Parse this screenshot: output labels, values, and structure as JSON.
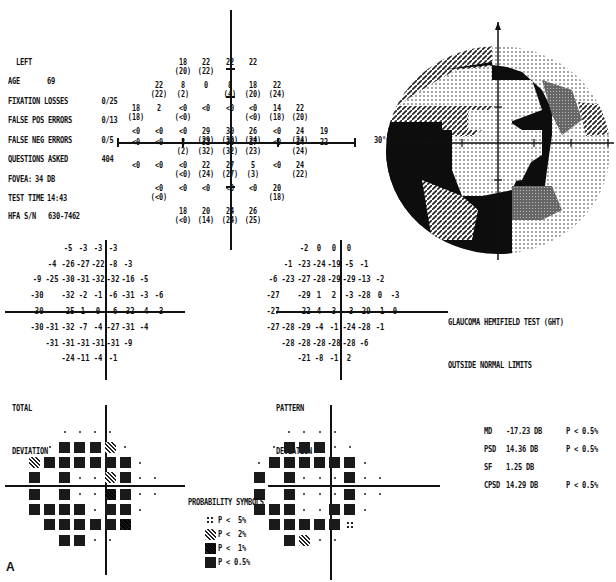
{
  "header": {
    "eye": "LEFT",
    "rows": [
      {
        "label": "AGE",
        "value": "69"
      },
      {
        "label": "FIXATION LOSSES",
        "value": "0/25"
      },
      {
        "label": "FALSE POS ERRORS",
        "value": "0/13"
      },
      {
        "label": "FALSE NEG ERRORS",
        "value": "0/5"
      },
      {
        "label": "QUESTIONS ASKED",
        "value": "404"
      },
      {
        "label": "FOVEA:",
        "value": "34 DB"
      },
      {
        "label": "TEST TIME",
        "value": "14:43"
      }
    ],
    "serial": "HFA S/N   630-7462"
  },
  "grayscale": {
    "angle_label": "30°"
  },
  "labels": {
    "total_deviation": [
      "TOTAL",
      "DEVIATION"
    ],
    "pattern_deviation": [
      "PATTERN",
      "DEVIATION"
    ],
    "figure_letter": "A"
  },
  "ght": {
    "line1": "GLAUCOMA HEMIFIELD TEST (GHT)",
    "line2": "OUTSIDE NORMAL LIMITS"
  },
  "indices": [
    {
      "name": "MD",
      "value": "-17.23 DB",
      "p": "P < 0.5%"
    },
    {
      "name": "PSD",
      "value": "14.36 DB",
      "p": "P < 0.5%"
    },
    {
      "name": "SF",
      "value": "1.25 DB",
      "p": ""
    },
    {
      "name": "CPSD",
      "value": "14.29 DB",
      "p": "P < 0.5%"
    }
  ],
  "legend": {
    "title": "PROBABILITY SYMBOLS",
    "items": [
      {
        "symbol": "p5",
        "label": "P <  5%"
      },
      {
        "symbol": "p2",
        "label": "P <  2%"
      },
      {
        "symbol": "p1",
        "label": "P <  1%"
      },
      {
        "symbol": "sq",
        "label": "P < 0.5%"
      }
    ]
  },
  "chart_data": [
    {
      "type": "table",
      "title": "Threshold values (dB), repeat in parentheses",
      "rows": [
        [
          "",
          "",
          "",
          "18 (20)",
          "22 (22)",
          "22",
          "22",
          "",
          "",
          ""
        ],
        [
          "",
          "",
          "22 (22)",
          "8 (2)",
          "0",
          "8 (4)",
          "18 (20)",
          "22 (24)",
          "",
          ""
        ],
        [
          "",
          "18 (18)",
          "2",
          "<0 (<0)",
          "<0",
          "<0",
          "<0 (<0)",
          "14 (18)",
          "22 (20)",
          ""
        ],
        [
          "",
          "<0",
          "<0",
          "<0",
          "29 (29)",
          "30 (30)",
          "26 (24)",
          "<0",
          "24 (24)",
          "19"
        ],
        [
          "",
          "<0",
          "<0",
          "8 (2)",
          "32 (32)",
          "30 (32)",
          "27 (23)",
          "<0",
          "24 (24)",
          "22"
        ],
        [
          "",
          "<0",
          "<0",
          "<0 (<0)",
          "22 (24)",
          "27 (27)",
          "5 (3)",
          "<0",
          "24 (22)",
          ""
        ],
        [
          "",
          "",
          "<0 (<0)",
          "<0",
          "<0",
          "<0",
          "<0",
          "20 (18)",
          "",
          ""
        ],
        [
          "",
          "",
          "",
          "18 (<0)",
          "20 (14)",
          "24 (24)",
          "26 (25)",
          "",
          "",
          ""
        ]
      ]
    },
    {
      "type": "table",
      "title": "TOTAL DEVIATION",
      "rows": [
        [
          "",
          "",
          "",
          "-5",
          "-3",
          "-3",
          "-3",
          "",
          "",
          ""
        ],
        [
          "",
          "",
          "-4",
          "-26",
          "-27",
          "-22",
          "-8",
          "-3",
          "",
          ""
        ],
        [
          "",
          "-9",
          "-25",
          "-30",
          "-31",
          "-32",
          "-32",
          "-16",
          "-5",
          ""
        ],
        [
          "",
          "-30",
          "",
          "-32",
          "-2",
          "-1",
          "-6",
          "-31",
          "-3",
          "-6"
        ],
        [
          "",
          "-30",
          "",
          "-25",
          "1",
          "0",
          "-6",
          "-32",
          "-4",
          "-3"
        ],
        [
          "",
          "-30",
          "-31",
          "-32",
          "-7",
          "-4",
          "-27",
          "-31",
          "-4",
          ""
        ],
        [
          "",
          "",
          "-31",
          "-31",
          "-31",
          "-31",
          "-31",
          "-9",
          "",
          ""
        ],
        [
          "",
          "",
          "",
          "-24",
          "-11",
          "-4",
          "-1",
          "",
          "",
          ""
        ]
      ]
    },
    {
      "type": "table",
      "title": "PATTERN DEVIATION",
      "rows": [
        [
          "",
          "",
          "",
          "-2",
          "0",
          "0",
          "0",
          "",
          "",
          ""
        ],
        [
          "",
          "",
          "-1",
          "-23",
          "-24",
          "-19",
          "-5",
          "-1",
          "",
          ""
        ],
        [
          "",
          "-6",
          "-23",
          "-27",
          "-28",
          "-29",
          "-29",
          "-13",
          "-2",
          ""
        ],
        [
          "",
          "-27",
          "",
          "-29",
          "1",
          "2",
          "-3",
          "-28",
          "0",
          "-3"
        ],
        [
          "",
          "-27",
          "",
          "-22",
          "4",
          "3",
          "-3",
          "-29",
          "-1",
          "0"
        ],
        [
          "",
          "-27",
          "-28",
          "-29",
          "-4",
          "-1",
          "-24",
          "-28",
          "-1",
          ""
        ],
        [
          "",
          "",
          "-28",
          "-28",
          "-28",
          "-28",
          "-28",
          "-6",
          "",
          ""
        ],
        [
          "",
          "",
          "",
          "-21",
          "-8",
          "-1",
          "2",
          "",
          "",
          ""
        ]
      ]
    },
    {
      "type": "heatmap",
      "title": "TOTAL DEVIATION probability map",
      "legend": {
        "dot": "normal",
        "p5": "P<5%",
        "p2": "P<2%",
        "p1": "P<1%",
        "sq": "P<0.5%"
      },
      "rows": [
        [
          "",
          "",
          "",
          "dot",
          "dot",
          "dot",
          "dot",
          "",
          "",
          ""
        ],
        [
          "",
          "",
          "dot",
          "sq",
          "sq",
          "sq",
          "p2",
          "dot",
          "",
          ""
        ],
        [
          "",
          "p2",
          "sq",
          "sq",
          "sq",
          "sq",
          "sq",
          "sq",
          "dot",
          ""
        ],
        [
          "",
          "sq",
          "",
          "sq",
          "dot",
          "dot",
          "p2",
          "sq",
          "dot",
          "dot"
        ],
        [
          "",
          "sq",
          "",
          "sq",
          "dot",
          "dot",
          "p1",
          "sq",
          "dot",
          "dot"
        ],
        [
          "",
          "sq",
          "sq",
          "sq",
          "sq",
          "dot",
          "sq",
          "sq",
          "dot",
          ""
        ],
        [
          "",
          "",
          "sq",
          "sq",
          "sq",
          "sq",
          "sq",
          "p1",
          "",
          ""
        ],
        [
          "",
          "",
          "",
          "sq",
          "sq",
          "dot",
          "dot",
          "",
          "",
          ""
        ]
      ]
    },
    {
      "type": "heatmap",
      "title": "PATTERN DEVIATION probability map",
      "legend": {
        "dot": "normal",
        "p5": "P<5%",
        "p2": "P<2%",
        "p1": "P<1%",
        "sq": "P<0.5%"
      },
      "rows": [
        [
          "",
          "",
          "",
          "dot",
          "dot",
          "dot",
          "dot",
          "",
          "",
          ""
        ],
        [
          "",
          "",
          "dot",
          "sq",
          "sq",
          "sq",
          "dot",
          "dot",
          "",
          ""
        ],
        [
          "",
          "dot",
          "sq",
          "sq",
          "sq",
          "sq",
          "sq",
          "sq",
          "dot",
          ""
        ],
        [
          "",
          "sq",
          "",
          "sq",
          "dot",
          "dot",
          "dot",
          "sq",
          "dot",
          "dot"
        ],
        [
          "",
          "sq",
          "",
          "sq",
          "dot",
          "dot",
          "dot",
          "sq",
          "dot",
          "dot"
        ],
        [
          "",
          "sq",
          "sq",
          "sq",
          "dot",
          "dot",
          "sq",
          "sq",
          "dot",
          ""
        ],
        [
          "",
          "",
          "sq",
          "sq",
          "sq",
          "sq",
          "sq",
          "p5",
          "",
          ""
        ],
        [
          "",
          "",
          "",
          "sq",
          "p2",
          "dot",
          "dot",
          "",
          "",
          ""
        ]
      ]
    }
  ]
}
